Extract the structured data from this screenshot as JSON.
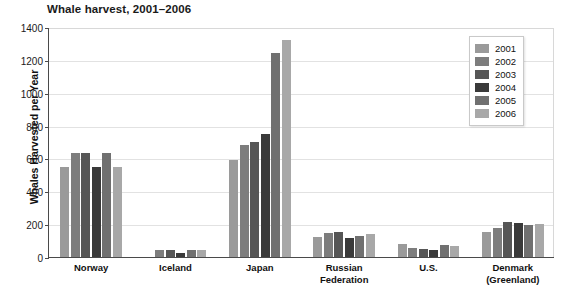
{
  "chart_data": {
    "type": "bar",
    "title": "Whale harvest, 2001–2006",
    "xlabel": "",
    "ylabel": "Whales Harvested  per Year",
    "ylim": [
      0,
      1400
    ],
    "ytick_step": 200,
    "yticks": [
      "1400",
      "1200",
      "1000",
      "800",
      "600",
      "400",
      "200",
      "0"
    ],
    "grid": true,
    "legend_position": "top-right",
    "categories": [
      "Norway",
      "Iceland",
      "Japan",
      "Russian\nFederation",
      "U.S.",
      "Denmark\n(Greenland)"
    ],
    "series": [
      {
        "name": "2001",
        "color": "#9a9a9a",
        "values": [
          545,
          0,
          590,
          120,
          80,
          155
        ]
      },
      {
        "name": "2002",
        "color": "#7d7d7d",
        "values": [
          635,
          40,
          680,
          145,
          55,
          175
        ]
      },
      {
        "name": "2003",
        "color": "#565656",
        "values": [
          635,
          40,
          700,
          150,
          50,
          215
        ]
      },
      {
        "name": "2004",
        "color": "#3a3a3a",
        "values": [
          545,
          25,
          750,
          115,
          45,
          210
        ]
      },
      {
        "name": "2005",
        "color": "#707070",
        "values": [
          635,
          40,
          1240,
          130,
          75,
          195
        ]
      },
      {
        "name": "2006",
        "color": "#a8a8a8",
        "values": [
          545,
          45,
          1320,
          140,
          70,
          200
        ]
      }
    ]
  },
  "legend": {
    "items": [
      {
        "label": "2001",
        "color": "#9a9a9a"
      },
      {
        "label": "2002",
        "color": "#7d7d7d"
      },
      {
        "label": "2003",
        "color": "#565656"
      },
      {
        "label": "2004",
        "color": "#3a3a3a"
      },
      {
        "label": "2005",
        "color": "#707070"
      },
      {
        "label": "2006",
        "color": "#a8a8a8"
      }
    ]
  },
  "colors": {
    "axis": "#4a4a4a",
    "gridline": "#e2e2e2",
    "text": "#111111",
    "background": "#ffffff"
  }
}
